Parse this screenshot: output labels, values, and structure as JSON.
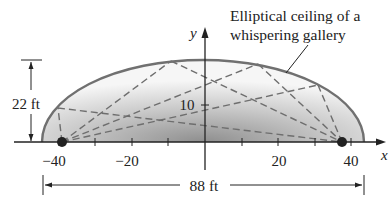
{
  "diagram": {
    "title": "Elliptical ceiling of a whispering gallery",
    "caption_lines": [
      "Elliptical ceiling of a",
      "whispering gallery"
    ],
    "axes": {
      "x_label": "x",
      "y_label": "y",
      "x_ticks": [
        {
          "value": -40,
          "label": "−40"
        },
        {
          "value": -30,
          "label": ""
        },
        {
          "value": -20,
          "label": "−20"
        },
        {
          "value": -10,
          "label": ""
        },
        {
          "value": 10,
          "label": ""
        },
        {
          "value": 20,
          "label": "20"
        },
        {
          "value": 30,
          "label": ""
        },
        {
          "value": 40,
          "label": "40"
        }
      ],
      "y_ticks": [
        {
          "value": 10,
          "label": "10"
        }
      ]
    },
    "ellipse": {
      "semi_major_ft": 44,
      "semi_minor_ft": 22,
      "height_label": "22 ft",
      "width_label": "88 ft",
      "foci_x": [
        -38,
        38
      ]
    },
    "colors": {
      "ellipse_stroke": "#707070",
      "fill_dark": "#9a9a9a",
      "fill_light": "#f4f4f4",
      "dashes": "#6e6e6e",
      "focus": "#222222"
    }
  }
}
